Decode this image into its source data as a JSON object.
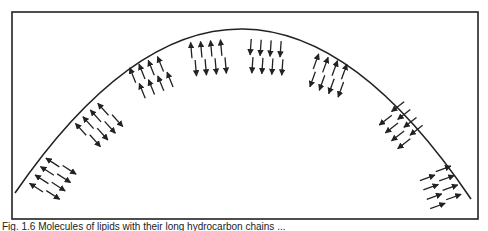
{
  "figure": {
    "frame": {
      "x": 12,
      "y": 12,
      "w": 466,
      "h": 207,
      "stroke": "#222222"
    },
    "arc": {
      "start": [
        15,
        193
      ],
      "control": [
        243,
        -138
      ],
      "end": [
        471,
        199
      ],
      "stroke": "#222222"
    },
    "arrow_color": "#222222",
    "groups": [
      {
        "cx": 52,
        "cy": 180,
        "angle": -57,
        "rows": [
          "out",
          "in"
        ]
      },
      {
        "cx": 98,
        "cy": 126,
        "angle": -42,
        "rows": [
          "out",
          "in"
        ]
      },
      {
        "cx": 150,
        "cy": 78,
        "angle": -22,
        "rows": [
          "out",
          "out"
        ]
      },
      {
        "cx": 207,
        "cy": 58,
        "angle": -5,
        "rows": [
          "out",
          "in"
        ]
      },
      {
        "cx": 265,
        "cy": 57,
        "angle": 4,
        "rows": [
          "in",
          "in"
        ]
      },
      {
        "cx": 327,
        "cy": 75,
        "angle": 20,
        "rows": [
          "out",
          "in"
        ]
      },
      {
        "cx": 400,
        "cy": 124,
        "angle": 52,
        "rows": [
          "in",
          "in"
        ]
      },
      {
        "cx": 440,
        "cy": 186,
        "angle": 70,
        "rows": [
          "out",
          "out"
        ]
      }
    ]
  },
  "caption": {
    "text": "Fig. 1.6 Molecules of lipids with their long hydrocarbon chains ..."
  }
}
